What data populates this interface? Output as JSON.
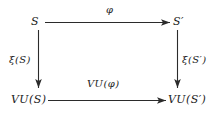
{
  "diagram": {
    "type": "commutative-square",
    "title": "",
    "nodes": [
      {
        "id": "top-left",
        "label": "S",
        "position": "top-left"
      },
      {
        "id": "top-right",
        "label": "S′",
        "position": "top-right"
      },
      {
        "id": "bottom-left",
        "label": "VU(S)",
        "position": "bottom-left"
      },
      {
        "id": "bottom-right",
        "label": "VU(S′)",
        "position": "bottom-right"
      }
    ],
    "edges": [
      {
        "id": "top",
        "from": "top-left",
        "to": "top-right",
        "label": "φ",
        "direction": "right"
      },
      {
        "id": "left",
        "from": "top-left",
        "to": "bottom-left",
        "label": "ξ(S)",
        "direction": "down"
      },
      {
        "id": "right",
        "from": "top-right",
        "to": "bottom-right",
        "label": "ξ(S′)",
        "direction": "down"
      },
      {
        "id": "bottom",
        "from": "bottom-left",
        "to": "bottom-right",
        "label": "VU(φ)",
        "direction": "right"
      }
    ],
    "colors": {
      "background": "#ffffff",
      "ink": "#1b1b1b",
      "arrow": "#2b2b2b"
    }
  }
}
